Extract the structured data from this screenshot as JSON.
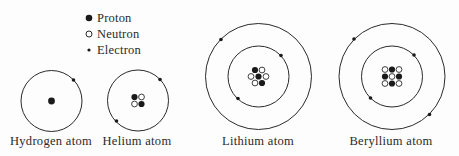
{
  "legend": {
    "items": [
      {
        "symbol": "proton",
        "label": "Proton"
      },
      {
        "symbol": "neutron",
        "label": "Neutron"
      },
      {
        "symbol": "electron",
        "label": "Electron"
      }
    ]
  },
  "atoms": [
    {
      "name": "hydrogen",
      "label": "Hydrogen atom",
      "protons": 1,
      "neutrons": 0,
      "electrons": 1,
      "shells": 1
    },
    {
      "name": "helium",
      "label": "Helium atom",
      "protons": 2,
      "neutrons": 2,
      "electrons": 2,
      "shells": 1
    },
    {
      "name": "lithium",
      "label": "Lithium atom",
      "protons": 3,
      "neutrons": 4,
      "electrons": 3,
      "shells": 2
    },
    {
      "name": "beryllium",
      "label": "Beryllium atom",
      "protons": 4,
      "neutrons": 5,
      "electrons": 4,
      "shells": 2
    }
  ],
  "colors": {
    "line": "#2a2a2a",
    "proton_fill": "#1a1a1a",
    "neutron_fill": "#ffffff",
    "background": "#fdfdfd"
  }
}
